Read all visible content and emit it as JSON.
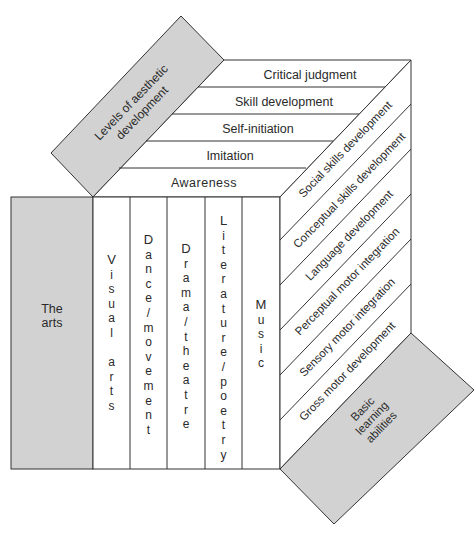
{
  "diagram": {
    "colors": {
      "gray": "#d2d2d2",
      "line": "#333333",
      "face": "#ffffff"
    },
    "top_panel": {
      "label_line1": "Levels of aesthetic",
      "label_line2": "development"
    },
    "levels": [
      "Critical judgment",
      "Skill development",
      "Self-initiation",
      "Imitation",
      "Awareness"
    ],
    "left_panel": {
      "label_line1": "The",
      "label_line2": "arts"
    },
    "arts": [
      {
        "name": "Visual arts",
        "letters": [
          "V",
          "i",
          "s",
          "u",
          "a",
          "l",
          "",
          "a",
          "r",
          "t",
          "s"
        ]
      },
      {
        "name": "Dance/movement",
        "letters": [
          "D",
          "a",
          "n",
          "c",
          "e",
          "/",
          "m",
          "o",
          "v",
          "e",
          "m",
          "e",
          "n",
          "t"
        ]
      },
      {
        "name": "Drama/theatre",
        "letters": [
          "D",
          "r",
          "a",
          "m",
          "a",
          "/",
          "t",
          "h",
          "e",
          "a",
          "t",
          "r",
          "e"
        ]
      },
      {
        "name": "Literature/poetry",
        "letters": [
          "L",
          "i",
          "t",
          "e",
          "r",
          "a",
          "t",
          "u",
          "r",
          "e",
          "/",
          "p",
          "o",
          "e",
          "t",
          "r",
          "y"
        ]
      },
      {
        "name": "Music",
        "letters": [
          "M",
          "u",
          "s",
          "i",
          "c"
        ]
      }
    ],
    "abilities": [
      "Social skills development",
      "Conceptual skills development",
      "Language development",
      "Perceptual motor integration",
      "Sensory motor integration",
      "Gross motor development"
    ],
    "bottom_panel": {
      "label_line1": "Basic",
      "label_line2": "learning",
      "label_line3": "abilities"
    }
  }
}
